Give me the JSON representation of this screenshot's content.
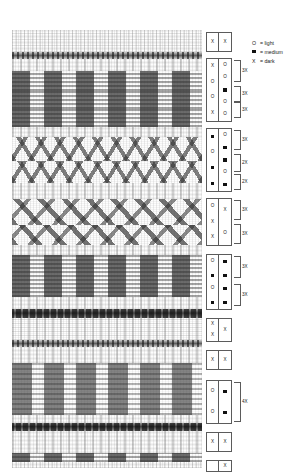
{
  "figure": {
    "symbols": {
      "light": "O",
      "medium": "■",
      "dark": "X"
    }
  },
  "legend": {
    "items": [
      {
        "symbol": "O",
        "type": "char",
        "label": "= light"
      },
      {
        "symbol": "■",
        "type": "square",
        "label": "= medium"
      },
      {
        "symbol": "X",
        "type": "char",
        "label": "= dark"
      }
    ]
  },
  "fabric": {
    "bands": [
      {
        "name": "speckle-top",
        "style": "b-plain",
        "top": 0,
        "height": 22
      },
      {
        "name": "cord-1",
        "style": "b-cord-thin",
        "top": 22,
        "height": 7
      },
      {
        "name": "speckle-2",
        "style": "b-speck",
        "top": 29,
        "height": 12
      },
      {
        "name": "blocks-1",
        "style": "b-blocks",
        "top": 41,
        "height": 20
      },
      {
        "name": "blocks-2",
        "style": "b-blocks",
        "top": 61,
        "height": 18
      },
      {
        "name": "blocks-3",
        "style": "b-blocks",
        "top": 79,
        "height": 18
      },
      {
        "name": "speckle-3",
        "style": "b-speck",
        "top": 97,
        "height": 10
      },
      {
        "name": "zigzag-1",
        "style": "b-zig",
        "top": 107,
        "height": 24
      },
      {
        "name": "zigzag-2",
        "style": "b-zig",
        "top": 131,
        "height": 22
      },
      {
        "name": "speckle-4",
        "style": "b-speck",
        "top": 153,
        "height": 16
      },
      {
        "name": "zigzag-3",
        "style": "b-zig2",
        "top": 169,
        "height": 26
      },
      {
        "name": "zigzag-4",
        "style": "b-zig2",
        "top": 195,
        "height": 20
      },
      {
        "name": "speckle-5",
        "style": "b-speck",
        "top": 215,
        "height": 10
      },
      {
        "name": "blocks-4",
        "style": "b-blocks",
        "top": 225,
        "height": 22
      },
      {
        "name": "blocks-5",
        "style": "b-blocks",
        "top": 247,
        "height": 20
      },
      {
        "name": "speckle-6",
        "style": "b-speck",
        "top": 267,
        "height": 12
      },
      {
        "name": "cord-2",
        "style": "b-cord",
        "top": 279,
        "height": 9
      },
      {
        "name": "speckle-7",
        "style": "b-speck",
        "top": 288,
        "height": 22
      },
      {
        "name": "cord-3",
        "style": "b-cord-thin",
        "top": 310,
        "height": 7
      },
      {
        "name": "speckle-8",
        "style": "b-speck",
        "top": 317,
        "height": 16
      },
      {
        "name": "blocks-tall-1",
        "style": "b-blocks-tall",
        "top": 333,
        "height": 52
      },
      {
        "name": "speckle-9",
        "style": "b-speck",
        "top": 385,
        "height": 8
      },
      {
        "name": "cord-4",
        "style": "b-cord",
        "top": 393,
        "height": 8
      },
      {
        "name": "speckle-10",
        "style": "b-speck",
        "top": 401,
        "height": 22
      },
      {
        "name": "dashes-bottom",
        "style": "b-blocks",
        "top": 423,
        "height": 9
      },
      {
        "name": "speckle-11",
        "style": "b-plain",
        "top": 432,
        "height": 6
      }
    ]
  },
  "notation": {
    "blocks": [
      {
        "name": "notation-block-1",
        "top": 0,
        "width": 26,
        "height": 20,
        "left_cells": [
          {
            "symbol": "X",
            "type": "char"
          }
        ],
        "right_cells": [
          {
            "symbol": "X",
            "type": "char"
          }
        ],
        "brackets": []
      },
      {
        "name": "notation-block-2",
        "top": 26,
        "width": 26,
        "height": 64,
        "left_cells": [
          {
            "symbol": "X",
            "type": "char"
          },
          {
            "symbol": "O",
            "type": "char"
          },
          {
            "symbol": "O",
            "type": "char"
          },
          {
            "symbol": "X",
            "type": "char"
          }
        ],
        "right_cells": [
          {
            "symbol": "O",
            "type": "char"
          },
          {
            "symbol": "O",
            "type": "char"
          },
          {
            "symbol": "■",
            "type": "square"
          },
          {
            "symbol": "O",
            "type": "char"
          },
          {
            "symbol": "O",
            "type": "char"
          }
        ],
        "brackets": [
          {
            "label": "3X",
            "top": 2,
            "height": 22
          },
          {
            "label": "3X",
            "top": 28,
            "height": 16
          },
          {
            "label": "3X",
            "top": 44,
            "height": 16
          }
        ]
      },
      {
        "name": "notation-block-3",
        "top": 96,
        "width": 26,
        "height": 64,
        "left_cells": [
          {
            "symbol": "■",
            "type": "square"
          },
          {
            "symbol": "O",
            "type": "char"
          },
          {
            "symbol": "■",
            "type": "square"
          },
          {
            "symbol": "■",
            "type": "square"
          }
        ],
        "right_cells": [
          {
            "symbol": "O",
            "type": "char"
          },
          {
            "symbol": "■",
            "type": "square"
          },
          {
            "symbol": "■",
            "type": "square"
          },
          {
            "symbol": "O",
            "type": "char"
          },
          {
            "symbol": "■",
            "type": "square"
          }
        ],
        "brackets": [
          {
            "label": "3X",
            "top": 2,
            "height": 20
          },
          {
            "label": "2X",
            "top": 26,
            "height": 18
          },
          {
            "label": "2X",
            "top": 46,
            "height": 16
          }
        ]
      },
      {
        "name": "notation-block-4",
        "top": 166,
        "width": 26,
        "height": 48,
        "left_cells": [
          {
            "symbol": "O",
            "type": "char"
          },
          {
            "symbol": "X",
            "type": "char"
          },
          {
            "symbol": "X",
            "type": "char"
          }
        ],
        "right_cells": [
          {
            "symbol": "X",
            "type": "char"
          },
          {
            "symbol": "O",
            "type": "char"
          }
        ],
        "brackets": [
          {
            "label": "3X",
            "top": 2,
            "height": 20
          },
          {
            "label": "3X",
            "top": 26,
            "height": 20
          }
        ]
      },
      {
        "name": "notation-block-5",
        "top": 222,
        "width": 26,
        "height": 56,
        "left_cells": [
          {
            "symbol": "O",
            "type": "char"
          },
          {
            "symbol": "■",
            "type": "square"
          },
          {
            "symbol": "O",
            "type": "char"
          },
          {
            "symbol": "■",
            "type": "square"
          }
        ],
        "right_cells": [
          {
            "symbol": "■",
            "type": "square"
          },
          {
            "symbol": "■",
            "type": "square"
          },
          {
            "symbol": "■",
            "type": "square"
          },
          {
            "symbol": "■",
            "type": "square"
          }
        ],
        "brackets": [
          {
            "label": "3X",
            "top": 2,
            "height": 22
          },
          {
            "label": "3X",
            "top": 30,
            "height": 22
          }
        ]
      },
      {
        "name": "notation-block-6",
        "top": 286,
        "width": 26,
        "height": 24,
        "left_cells": [
          {
            "symbol": "X",
            "type": "char"
          },
          {
            "symbol": "X",
            "type": "char"
          }
        ],
        "right_cells": [
          {
            "symbol": "X",
            "type": "char"
          }
        ],
        "brackets": []
      },
      {
        "name": "notation-block-7",
        "top": 318,
        "width": 26,
        "height": 20,
        "left_cells": [
          {
            "symbol": "X",
            "type": "char"
          }
        ],
        "right_cells": [
          {
            "symbol": "X",
            "type": "char"
          }
        ],
        "brackets": []
      },
      {
        "name": "notation-block-8",
        "top": 348,
        "width": 26,
        "height": 44,
        "left_cells": [
          {
            "symbol": "O",
            "type": "char"
          },
          {
            "symbol": "O",
            "type": "char"
          }
        ],
        "right_cells": [
          {
            "symbol": "■",
            "type": "square"
          },
          {
            "symbol": "■",
            "type": "square"
          }
        ],
        "brackets": [
          {
            "label": "4X",
            "top": 2,
            "height": 40
          }
        ]
      },
      {
        "name": "notation-block-9",
        "top": 400,
        "width": 26,
        "height": 20,
        "left_cells": [
          {
            "symbol": "X",
            "type": "char"
          }
        ],
        "right_cells": [
          {
            "symbol": "X",
            "type": "char"
          }
        ],
        "brackets": []
      },
      {
        "name": "notation-block-10",
        "top": 428,
        "width": 26,
        "height": 12,
        "left_cells": [],
        "right_cells": [
          {
            "symbol": "X",
            "type": "char"
          }
        ],
        "brackets": []
      }
    ]
  }
}
